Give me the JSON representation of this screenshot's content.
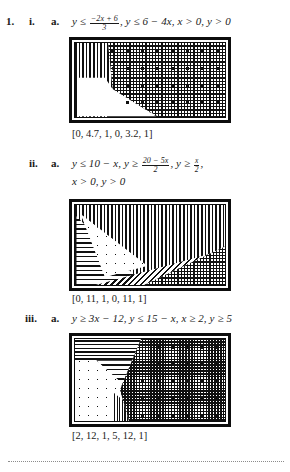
{
  "page": {
    "problem_number": "1.",
    "bottom_rule": "dotted-divider"
  },
  "items": [
    {
      "roman": "i.",
      "alpha": "a.",
      "expr_parts": {
        "lead": "y ≤ ",
        "frac_num": "−2x + 6",
        "frac_den": "3",
        "tail": ", y ≤ 6 − 4x, x > 0, y > 0"
      },
      "expr_plain": "y ≤ (−2x + 6)/3, y ≤ 6 − 4x, x > 0, y > 0",
      "caption": "[0, 4.7, 1, 0, 3.2, 1]",
      "graph": {
        "name": "feasible-region-graph-1",
        "window": {
          "xmin": 0,
          "xmax": 4.7,
          "xscl": 1,
          "ymin": 0,
          "ymax": 3.2,
          "yscl": 1
        },
        "regions": [
          "vertical-stripes",
          "grid-crosshatch",
          "horizontal-stripes",
          "white-feasible-polygon",
          "large-dots"
        ]
      }
    },
    {
      "roman": "ii.",
      "alpha": "a.",
      "expr_parts": {
        "lead": "y ≤ 10 − x, y ≥ ",
        "frac_num": "20 − 5x",
        "frac_den": "2",
        "mid": ", y ≥ ",
        "frac2_num": "x",
        "frac2_den": "2",
        "tail": ",",
        "line2": "x > 0, y > 0"
      },
      "expr_plain": "y ≤ 10 − x, y ≥ (20 − 5x)/2, y ≥ x/2, x > 0, y > 0",
      "caption": "[0, 11, 1, 0, 11, 1]",
      "graph": {
        "name": "feasible-region-graph-2",
        "window": {
          "xmin": 0,
          "xmax": 11,
          "xscl": 1,
          "ymin": 0,
          "ymax": 11,
          "yscl": 1
        },
        "regions": [
          "vertical-stripes",
          "horizontal-stripes",
          "diagonal-hatch",
          "grid-crosshatch",
          "white-feasible-triangle",
          "small-dots"
        ]
      }
    },
    {
      "roman": "iii.",
      "alpha": "a.",
      "expr_parts": {
        "lead": "y ≥ 3x − 12, y ≤ 15 − x, x ≥ 2, y ≥ 5",
        "frac_num": "",
        "frac_den": "",
        "tail": ""
      },
      "expr_plain": "y ≥ 3x − 12, y ≤ 15 − x, x ≥ 2, y ≥ 5",
      "caption": "[2, 12, 1, 5, 12, 1]",
      "graph": {
        "name": "feasible-region-graph-3",
        "window": {
          "xmin": 2,
          "xmax": 12,
          "xscl": 1,
          "ymin": 5,
          "ymax": 12,
          "yscl": 1
        },
        "regions": [
          "horizontal-stripes",
          "dotted-region",
          "vertical-stripes",
          "grid-crosshatch",
          "white-feasible-polygon"
        ]
      }
    }
  ],
  "colors": {
    "ink": "#1a1a1a",
    "plot_ink": "#101010",
    "paper": "#ffffff",
    "rule": "#8c8c8c"
  }
}
